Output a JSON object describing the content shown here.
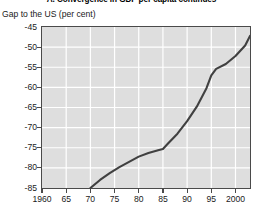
{
  "chart_data": {
    "type": "line",
    "title": "A. Convergence in GDP per capita continues",
    "subtitle": "",
    "ylabel": "Gap to the US (per cent)",
    "xlabel": "",
    "ylim": [
      -85,
      -45
    ],
    "xlim": [
      1960,
      2003
    ],
    "yticks": [
      -45,
      -50,
      -55,
      -60,
      -65,
      -70,
      -75,
      -80,
      -85
    ],
    "ytick_labels": [
      "-45",
      "-50",
      "-55",
      "-60",
      "-65",
      "-70",
      "-75",
      "-80",
      "-85"
    ],
    "xticks": [
      1960,
      1965,
      1970,
      1975,
      1980,
      1985,
      1990,
      1995,
      2000
    ],
    "xtick_labels": [
      "1960",
      "65",
      "70",
      "75",
      "80",
      "85",
      "90",
      "95",
      "2000"
    ],
    "grid": true,
    "grid_color": "#ffffff",
    "plot_background": "#dedede",
    "line_color": "#404040",
    "legend": null,
    "series": [
      {
        "name": "Gap to the US (per cent)",
        "x": [
          1970,
          1972,
          1974,
          1976,
          1978,
          1980,
          1982,
          1984,
          1985,
          1986,
          1988,
          1990,
          1992,
          1994,
          1995,
          1996,
          1998,
          2000,
          2002,
          2003
        ],
        "values": [
          -85.0,
          -83.0,
          -81.3,
          -79.8,
          -78.5,
          -77.2,
          -76.3,
          -75.6,
          -75.3,
          -74.0,
          -71.5,
          -68.4,
          -64.8,
          -60.2,
          -57.0,
          -55.4,
          -54.2,
          -52.2,
          -49.6,
          -47.2
        ]
      }
    ]
  }
}
